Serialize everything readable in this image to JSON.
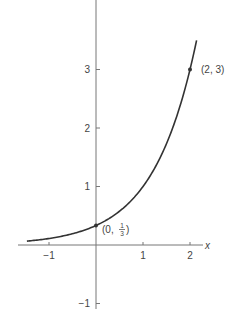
{
  "chart_data": {
    "type": "line",
    "title": "",
    "function": "y = (1/3)·3^x",
    "xlabel": "x",
    "ylabel": "",
    "xlim": [
      -1.47,
      2.14
    ],
    "ylim": [
      -1.1,
      4.2
    ],
    "grid": false,
    "legend": null,
    "x_ticks": [
      -1,
      1,
      2
    ],
    "x_tick_labels": [
      "−1",
      "1",
      "2"
    ],
    "y_ticks": [
      -1,
      1,
      2,
      3
    ],
    "y_tick_labels": [
      "−1",
      "1",
      "2",
      "3"
    ],
    "series": [
      {
        "name": "curve",
        "x": [
          -1.47,
          -1,
          -0.5,
          0,
          0.5,
          1,
          1.5,
          2,
          2.14
        ],
        "y": [
          0.066,
          0.111,
          0.192,
          0.333,
          0.577,
          1.0,
          1.732,
          3.0,
          3.5
        ]
      }
    ],
    "annotations": [
      {
        "x": 0,
        "y": 0.3333,
        "label": "(0, 1/3)",
        "label_parts": [
          "(0, ",
          "1",
          "3",
          ")"
        ]
      },
      {
        "x": 2,
        "y": 3,
        "label": "(2, 3)"
      }
    ]
  },
  "colors": {
    "axis": "#777777",
    "curve": "#333333",
    "text": "#444444"
  }
}
